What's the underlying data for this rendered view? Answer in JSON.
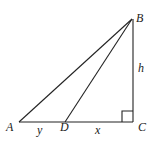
{
  "diagram": {
    "type": "right-triangle",
    "stroke_color": "#222222",
    "points": {
      "A": {
        "label": "A",
        "x": 19,
        "y": 122
      },
      "D": {
        "label": "D",
        "x": 65,
        "y": 122
      },
      "C": {
        "label": "C",
        "x": 133,
        "y": 122
      },
      "B": {
        "label": "B",
        "x": 132,
        "y": 19
      }
    },
    "segment_labels": {
      "AD": "y",
      "DC": "x",
      "BC": "h"
    },
    "right_angle_at": "C"
  }
}
